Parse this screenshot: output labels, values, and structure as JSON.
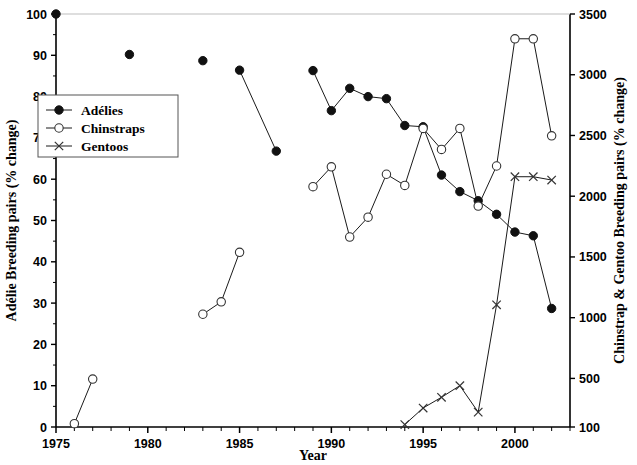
{
  "chart_data": {
    "type": "line",
    "title": "",
    "xlabel": "Year",
    "ylabel": "Adélie Breeding pairs (% change)",
    "ylabel_right": "Chinstrap & Gentoo Breeding pairs (% change)",
    "xlim": [
      1975,
      2003
    ],
    "ylim": [
      0,
      100
    ],
    "ylim_right": [
      100,
      3500
    ],
    "xticks": [
      1975,
      1980,
      1985,
      1990,
      1995,
      2000
    ],
    "xticks_minor_step": 1,
    "yticks": [
      0,
      10,
      20,
      30,
      40,
      50,
      60,
      70,
      80,
      90,
      100
    ],
    "yticks_right": [
      100,
      500,
      1000,
      1500,
      2000,
      2500,
      3000,
      3500
    ],
    "grid": false,
    "legend_position": "upper-left-inset",
    "series": [
      {
        "name": "Adélies",
        "axis": "left",
        "marker": "filled-circle",
        "points": [
          {
            "x": 1975,
            "y": 100.0
          },
          {
            "x": 1979,
            "y": 90.2
          },
          {
            "x": 1983,
            "y": 88.7
          },
          {
            "x": 1985,
            "y": 86.4
          },
          {
            "x": 1987,
            "y": 66.8
          },
          {
            "x": 1989,
            "y": 86.3
          },
          {
            "x": 1990,
            "y": 76.6
          },
          {
            "x": 1991,
            "y": 82.0
          },
          {
            "x": 1992,
            "y": 80.0
          },
          {
            "x": 1993,
            "y": 79.5
          },
          {
            "x": 1994,
            "y": 73.0
          },
          {
            "x": 1995,
            "y": 72.7
          },
          {
            "x": 1996,
            "y": 61.0
          },
          {
            "x": 1997,
            "y": 57.0
          },
          {
            "x": 1998,
            "y": 54.8
          },
          {
            "x": 1999,
            "y": 51.5
          },
          {
            "x": 2000,
            "y": 47.2
          },
          {
            "x": 2001,
            "y": 46.3
          },
          {
            "x": 2002,
            "y": 28.7
          }
        ],
        "segments": [
          [
            1985,
            1987
          ],
          [
            1989,
            1990,
            1991,
            1992,
            1993,
            1994,
            1995,
            1996,
            1997,
            1998,
            1999,
            2000,
            2001,
            2002
          ]
        ]
      },
      {
        "name": "Chinstraps",
        "axis": "left",
        "marker": "open-circle",
        "points": [
          {
            "x": 1976,
            "y": 0.8
          },
          {
            "x": 1977,
            "y": 11.6
          },
          {
            "x": 1983,
            "y": 27.3
          },
          {
            "x": 1984,
            "y": 30.3
          },
          {
            "x": 1985,
            "y": 42.3
          },
          {
            "x": 1989,
            "y": 58.2
          },
          {
            "x": 1990,
            "y": 63.0
          },
          {
            "x": 1991,
            "y": 46.0
          },
          {
            "x": 1992,
            "y": 50.8
          },
          {
            "x": 1993,
            "y": 61.2
          },
          {
            "x": 1994,
            "y": 58.5
          },
          {
            "x": 1995,
            "y": 72.3
          },
          {
            "x": 1996,
            "y": 67.2
          },
          {
            "x": 1997,
            "y": 72.3
          },
          {
            "x": 1998,
            "y": 53.5
          },
          {
            "x": 1999,
            "y": 63.2
          },
          {
            "x": 2000,
            "y": 94.0
          },
          {
            "x": 2001,
            "y": 94.0
          },
          {
            "x": 2002,
            "y": 70.5
          }
        ],
        "segments": [
          [
            1976,
            1977
          ],
          [
            1983,
            1984,
            1985
          ],
          [
            1989,
            1990,
            1991,
            1992,
            1993,
            1994,
            1995,
            1996,
            1997,
            1998,
            1999,
            2000,
            2001,
            2002
          ]
        ]
      },
      {
        "name": "Gentoos",
        "axis": "left",
        "marker": "cross-x",
        "points": [
          {
            "x": 1994,
            "y": 0.6
          },
          {
            "x": 1995,
            "y": 4.6
          },
          {
            "x": 1996,
            "y": 7.2
          },
          {
            "x": 1997,
            "y": 10.0
          },
          {
            "x": 1998,
            "y": 3.6
          },
          {
            "x": 1999,
            "y": 29.6
          },
          {
            "x": 2000,
            "y": 60.6
          },
          {
            "x": 2001,
            "y": 60.6
          },
          {
            "x": 2002,
            "y": 59.8
          }
        ],
        "segments": [
          [
            1994,
            1995,
            1996,
            1997,
            1998,
            1999,
            2000,
            2001,
            2002
          ]
        ]
      }
    ],
    "legend": [
      {
        "label": "Adélies",
        "marker": "filled-circle"
      },
      {
        "label": "Chinstraps",
        "marker": "open-circle"
      },
      {
        "label": "Gentoos",
        "marker": "cross-x"
      }
    ],
    "colors": {
      "axis": "#000000",
      "series": "#1a1a1a",
      "background": "#ffffff"
    }
  }
}
